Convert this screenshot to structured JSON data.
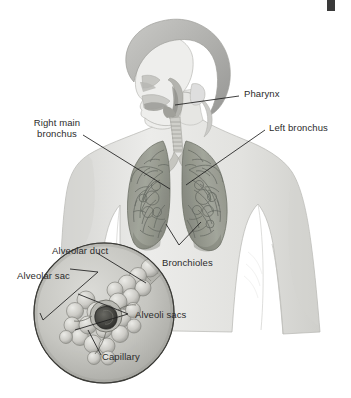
{
  "figure": {
    "page_mark": "black-register-mark"
  },
  "labels": {
    "pharynx": "Pharynx",
    "right_main_bronchus_line1": "Right main",
    "right_main_bronchus_line2": "bronchus",
    "left_bronchus": "Left bronchus",
    "bronchioles": "Bronchioles",
    "alveolar_duct": "Alveolar duct",
    "alveolar_sac": "Alveolar sac",
    "alveoli_sacs": "Alveoli sacs",
    "capillary": "Capillary"
  },
  "colors": {
    "skin": "#e3e3e1",
    "skin_shade": "#cfcfcd",
    "hair": "#b9b9b7",
    "lung": "#9b9e94",
    "lung_dark": "#6d7066",
    "trachea": "#c9c9c4",
    "inset_fill": "#c6c6c2",
    "alveoli": "#d6d6d2",
    "capillary_dark": "#4a4a46",
    "leader": "#1e1e1e",
    "text": "#2b2b2b",
    "background": "#ffffff"
  },
  "inset": {
    "shape": "circle",
    "center_x": 104,
    "center_y": 313,
    "radius": 70
  }
}
